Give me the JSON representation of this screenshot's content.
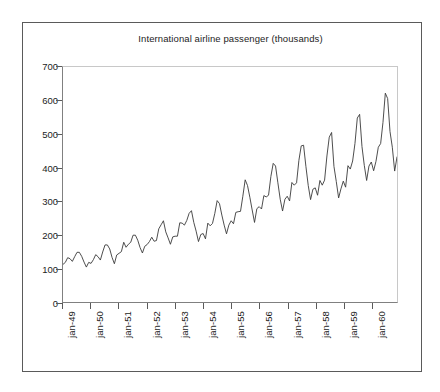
{
  "chart_data": {
    "type": "line",
    "title": "International airline passenger (thousands)",
    "xlabel": "",
    "ylabel": "",
    "ylim": [
      0,
      700
    ],
    "ytick_step": 100,
    "ytick_labels": [
      "0",
      "100",
      "200",
      "300",
      "400",
      "500",
      "600",
      "700"
    ],
    "ytick_values": [
      0,
      100,
      200,
      300,
      400,
      500,
      600,
      700
    ],
    "xtick_labels": [
      "jan-49",
      "jan-50",
      "jan-51",
      "jan-52",
      "jan-53",
      "jan-54",
      "jan-55",
      "jan-56",
      "jan-57",
      "jan-58",
      "jan-59",
      "jan-60"
    ],
    "xtick_indices": [
      0,
      12,
      24,
      36,
      48,
      60,
      72,
      84,
      96,
      108,
      120,
      132
    ],
    "grid": false,
    "legend": false,
    "legend_position": "none",
    "n_points": 144,
    "series": [
      {
        "name": "International airline passenger (thousands)",
        "color": "#3a3a3a",
        "line_width": 0.9,
        "values": [
          112,
          118,
          132,
          129,
          121,
          135,
          148,
          148,
          136,
          119,
          104,
          118,
          115,
          126,
          141,
          135,
          125,
          149,
          170,
          170,
          158,
          133,
          114,
          140,
          145,
          150,
          178,
          163,
          172,
          178,
          199,
          199,
          184,
          162,
          146,
          166,
          171,
          180,
          193,
          181,
          183,
          218,
          230,
          242,
          209,
          191,
          172,
          194,
          196,
          196,
          236,
          235,
          229,
          243,
          264,
          272,
          237,
          211,
          180,
          201,
          204,
          188,
          235,
          227,
          234,
          264,
          302,
          293,
          259,
          229,
          203,
          229,
          242,
          233,
          267,
          269,
          270,
          315,
          364,
          347,
          312,
          274,
          237,
          278,
          284,
          277,
          317,
          313,
          318,
          374,
          413,
          405,
          355,
          306,
          271,
          306,
          315,
          301,
          356,
          348,
          355,
          422,
          465,
          467,
          404,
          347,
          305,
          336,
          340,
          318,
          362,
          348,
          363,
          435,
          491,
          505,
          404,
          359,
          310,
          337,
          360,
          342,
          406,
          396,
          420,
          472,
          548,
          559,
          463,
          407,
          362,
          405,
          417,
          391,
          419,
          461,
          472,
          535,
          622,
          606,
          508,
          461,
          390,
          432
        ]
      }
    ]
  },
  "figure": {
    "bottom_caption_fragment": ""
  },
  "colors": {
    "line": "#3a3a3a",
    "axis": "#5a5a5a",
    "plot_border_light": "#c8c8c8",
    "outer_frame": "#5a5a5a",
    "text": "#1c1c1c",
    "background": "#ffffff"
  }
}
